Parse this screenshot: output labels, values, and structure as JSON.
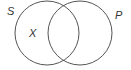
{
  "diagram": {
    "type": "venn",
    "sets": [
      {
        "label": "S",
        "cx": 47,
        "cy": 33,
        "r": 32
      },
      {
        "label": "P",
        "cx": 80,
        "cy": 33,
        "r": 32
      }
    ],
    "region_labels": [
      {
        "text": "X",
        "region": "S only"
      }
    ],
    "colors": {
      "stroke": "#555555",
      "text": "#333333"
    }
  }
}
